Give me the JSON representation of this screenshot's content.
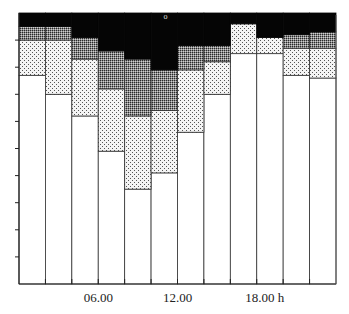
{
  "chart_data": {
    "type": "area",
    "subtype": "stacked-step",
    "title": "",
    "xlabel": "",
    "ylabel": "",
    "x_unit": "h",
    "x_range": [
      0,
      24
    ],
    "ylim": [
      0,
      100
    ],
    "grid": false,
    "legend": null,
    "x_ticks": [
      2,
      4,
      6,
      8,
      10,
      12,
      14,
      16,
      18,
      20,
      22
    ],
    "x_tick_labels": [
      {
        "x": 6,
        "label": "06.00"
      },
      {
        "x": 12,
        "label": "12.00"
      },
      {
        "x": 18,
        "label": "18.00 h"
      }
    ],
    "y_ticks": [
      10,
      20,
      30,
      40,
      50,
      60,
      70,
      80,
      90
    ],
    "bins": [
      [
        0,
        2
      ],
      [
        2,
        4
      ],
      [
        4,
        6
      ],
      [
        6,
        8
      ],
      [
        8,
        10
      ],
      [
        10,
        12
      ],
      [
        12,
        14
      ],
      [
        14,
        16
      ],
      [
        16,
        18
      ],
      [
        18,
        20
      ],
      [
        20,
        22
      ],
      [
        22,
        24
      ]
    ],
    "series": [
      {
        "name": "layer-1 (white)",
        "pattern": "white",
        "values": [
          77,
          70,
          62,
          49,
          35,
          41,
          56,
          70,
          85,
          85,
          77,
          76
        ]
      },
      {
        "name": "layer-2 (light dots)",
        "pattern": "light-dots",
        "values": [
          13,
          20,
          21,
          23,
          27,
          23,
          23,
          12,
          11,
          6,
          10,
          11
        ]
      },
      {
        "name": "layer-3 (dark stipple)",
        "pattern": "dark-stipple",
        "values": [
          5,
          5,
          8,
          14,
          21,
          15,
          9,
          6,
          0,
          0,
          5,
          6
        ]
      },
      {
        "name": "layer-4 (black)",
        "pattern": "black",
        "values": [
          5,
          5,
          9,
          14,
          17,
          21,
          12,
          12,
          4,
          9,
          8,
          7
        ]
      }
    ],
    "annotations": [
      {
        "x": 11.1,
        "y": 99,
        "label": "o"
      }
    ]
  }
}
